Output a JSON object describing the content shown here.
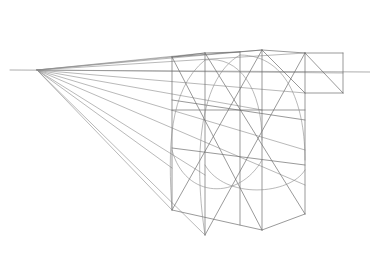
{
  "drawing": {
    "subject": "one-point perspective construction sketch",
    "stroke_color": "#8a8a8a",
    "stroke_dark": "#6e6e6e",
    "background": "#ffffff",
    "vanishing_point": [
      37,
      70
    ],
    "horizon": [
      [
        10,
        70
      ],
      [
        370,
        72
      ]
    ],
    "rays": [
      [
        [
          37,
          70
        ],
        [
          172,
          57
        ]
      ],
      [
        [
          37,
          70
        ],
        [
          205,
          53
        ]
      ],
      [
        [
          37,
          70
        ],
        [
          262,
          50
        ]
      ],
      [
        [
          37,
          70
        ],
        [
          305,
          53
        ]
      ],
      [
        [
          37,
          70
        ],
        [
          343,
          73
        ]
      ],
      [
        [
          37,
          70
        ],
        [
          305,
          93
        ]
      ],
      [
        [
          37,
          70
        ],
        [
          262,
          110
        ]
      ],
      [
        [
          37,
          70
        ],
        [
          305,
          150
        ]
      ],
      [
        [
          37,
          70
        ],
        [
          305,
          185
        ]
      ],
      [
        [
          37,
          70
        ],
        [
          172,
          168
        ]
      ],
      [
        [
          37,
          70
        ],
        [
          205,
          175
        ]
      ],
      [
        [
          37,
          70
        ],
        [
          172,
          210
        ]
      ],
      [
        [
          37,
          70
        ],
        [
          205,
          235
        ]
      ]
    ],
    "lines": [
      [
        [
          172,
          57
        ],
        [
          172,
          210
        ]
      ],
      [
        [
          205,
          53
        ],
        [
          205,
          235
        ]
      ],
      [
        [
          240,
          52
        ],
        [
          240,
          225
        ]
      ],
      [
        [
          262,
          50
        ],
        [
          262,
          230
        ]
      ],
      [
        [
          305,
          53
        ],
        [
          305,
          214
        ]
      ],
      [
        [
          172,
          57
        ],
        [
          262,
          50
        ]
      ],
      [
        [
          262,
          50
        ],
        [
          305,
          53
        ]
      ],
      [
        [
          305,
          53
        ],
        [
          343,
          53
        ]
      ],
      [
        [
          343,
          53
        ],
        [
          343,
          93
        ]
      ],
      [
        [
          343,
          93
        ],
        [
          305,
          93
        ]
      ],
      [
        [
          305,
          53
        ],
        [
          343,
          93
        ]
      ],
      [
        [
          262,
          50
        ],
        [
          305,
          93
        ]
      ],
      [
        [
          172,
          210
        ],
        [
          262,
          230
        ]
      ],
      [
        [
          262,
          230
        ],
        [
          305,
          214
        ]
      ],
      [
        [
          172,
          57
        ],
        [
          262,
          230
        ]
      ],
      [
        [
          262,
          50
        ],
        [
          172,
          210
        ]
      ],
      [
        [
          205,
          53
        ],
        [
          305,
          214
        ]
      ],
      [
        [
          305,
          53
        ],
        [
          205,
          235
        ]
      ],
      [
        [
          172,
          110
        ],
        [
          305,
          110
        ]
      ],
      [
        [
          172,
          100
        ],
        [
          305,
          120
        ]
      ],
      [
        [
          172,
          148
        ],
        [
          305,
          165
        ]
      ],
      [
        [
          172,
          57
        ],
        [
          205,
          53
        ]
      ],
      [
        [
          205,
          53
        ],
        [
          240,
          52
        ]
      ]
    ],
    "arcs": [
      "M 172 210 C 168 150, 168 90, 205 60",
      "M 205 235 C 195 170, 195 80, 240 55",
      "M 205 60 C 240 55, 262 90, 262 140",
      "M 240 55 C 290 55, 305 110, 305 160",
      "M 172 150 C 185 200, 240 200, 262 160",
      "M 205 165 C 225 200, 290 195, 305 170"
    ]
  }
}
